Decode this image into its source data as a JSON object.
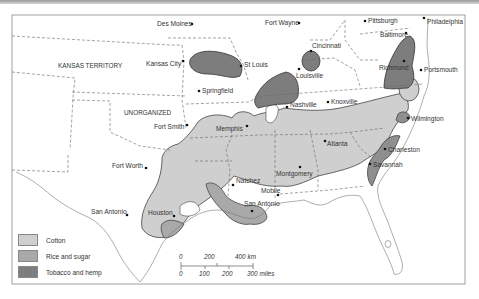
{
  "map": {
    "title": "",
    "colors": {
      "cotton": "#cfcfcf",
      "rice_sugar": "#a9a9a9",
      "tobacco_hemp": "#7d7d7d",
      "border": "#555555",
      "coast": "#777777"
    },
    "regions": {
      "kansas_territory": "KANSAS TERRITORY",
      "unorganized": "UNORGANIZED"
    },
    "cities": [
      {
        "name": "Des Moines",
        "x": 192,
        "y": 24
      },
      {
        "name": "Fort Wayne",
        "x": 299,
        "y": 23
      },
      {
        "name": "Pittsburgh",
        "x": 365,
        "y": 21
      },
      {
        "name": "Philadelphia",
        "x": 424,
        "y": 18
      },
      {
        "name": "Baltimore",
        "x": 405,
        "y": 33
      },
      {
        "name": "Kansas City",
        "x": 183,
        "y": 61
      },
      {
        "name": "St Louis",
        "x": 243,
        "y": 64
      },
      {
        "name": "Cincinnati",
        "x": 312,
        "y": 51
      },
      {
        "name": "Louisville",
        "x": 299,
        "y": 69
      },
      {
        "name": "Richmond",
        "x": 404,
        "y": 61
      },
      {
        "name": "Portsmouth",
        "x": 421,
        "y": 70
      },
      {
        "name": "Springfield",
        "x": 199,
        "y": 91
      },
      {
        "name": "Nashville",
        "x": 287,
        "y": 107
      },
      {
        "name": "Knoxville",
        "x": 328,
        "y": 102
      },
      {
        "name": "Fort Smith",
        "x": 187,
        "y": 125
      },
      {
        "name": "Memphis",
        "x": 246,
        "y": 125
      },
      {
        "name": "Wilmington",
        "x": 408,
        "y": 118
      },
      {
        "name": "Atlanta",
        "x": 327,
        "y": 144
      },
      {
        "name": "Charleston",
        "x": 385,
        "y": 149
      },
      {
        "name": "Fort Worth",
        "x": 146,
        "y": 168
      },
      {
        "name": "Montgomery",
        "x": 300,
        "y": 167
      },
      {
        "name": "Savannah",
        "x": 370,
        "y": 164
      },
      {
        "name": "Natchez",
        "x": 233,
        "y": 184
      },
      {
        "name": "Mobile",
        "x": 278,
        "y": 195
      },
      {
        "name": "New Orleans",
        "x": 261,
        "y": 212
      },
      {
        "name": "San Antonio",
        "x": 127,
        "y": 215
      },
      {
        "name": "Houston",
        "x": 174,
        "y": 216
      }
    ],
    "legend": [
      {
        "label": "Cotton",
        "key": "cotton"
      },
      {
        "label": "Rice and sugar",
        "key": "rice_sugar"
      },
      {
        "label": "Tobacco and hemp",
        "key": "tobacco_hemp"
      }
    ],
    "scale": {
      "km_labels": [
        "0",
        "200",
        "400 km"
      ],
      "mile_labels": [
        "0",
        "100",
        "200",
        "300 miles"
      ]
    }
  }
}
